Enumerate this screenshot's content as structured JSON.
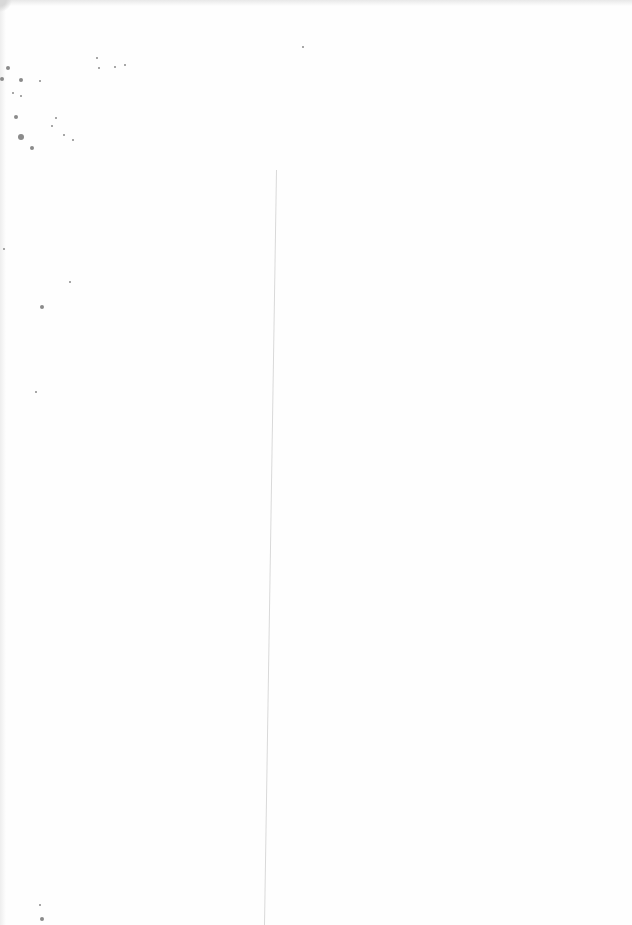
{
  "document": {
    "type": "scanned-blank-page",
    "text_content": "",
    "background_color": "#fefefe",
    "fold_line": {
      "x_top": 276,
      "y_top": 170,
      "x_bottom": 264,
      "y_bottom": 925,
      "color": "#d9d9d9"
    },
    "noise_specks": [
      {
        "x": 8,
        "y": 68,
        "r": 2
      },
      {
        "x": 2,
        "y": 79,
        "r": 2
      },
      {
        "x": 21,
        "y": 80,
        "r": 2
      },
      {
        "x": 40,
        "y": 81,
        "r": 1
      },
      {
        "x": 13,
        "y": 93,
        "r": 1
      },
      {
        "x": 21,
        "y": 96,
        "r": 1
      },
      {
        "x": 16,
        "y": 117,
        "r": 2
      },
      {
        "x": 56,
        "y": 118,
        "r": 1
      },
      {
        "x": 52,
        "y": 126,
        "r": 1
      },
      {
        "x": 21,
        "y": 137,
        "r": 3
      },
      {
        "x": 32,
        "y": 148,
        "r": 2
      },
      {
        "x": 64,
        "y": 135,
        "r": 1
      },
      {
        "x": 73,
        "y": 140,
        "r": 1
      },
      {
        "x": 97,
        "y": 58,
        "r": 1
      },
      {
        "x": 99,
        "y": 68,
        "r": 1
      },
      {
        "x": 115,
        "y": 67,
        "r": 1
      },
      {
        "x": 125,
        "y": 65,
        "r": 1
      },
      {
        "x": 4,
        "y": 249,
        "r": 1
      },
      {
        "x": 70,
        "y": 282,
        "r": 1
      },
      {
        "x": 42,
        "y": 307,
        "r": 2
      },
      {
        "x": 36,
        "y": 392,
        "r": 1
      },
      {
        "x": 303,
        "y": 47,
        "r": 1
      },
      {
        "x": 40,
        "y": 905,
        "r": 1
      },
      {
        "x": 42,
        "y": 919,
        "r": 2
      }
    ]
  }
}
